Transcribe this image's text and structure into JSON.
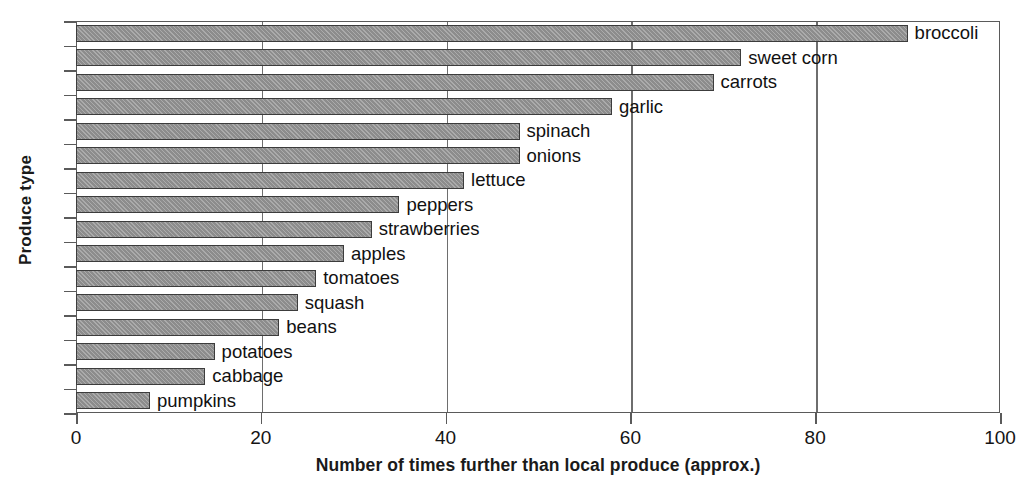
{
  "chart_data": {
    "type": "bar",
    "orientation": "horizontal",
    "title": "",
    "xlabel": "Number of times further than local produce (approx.)",
    "ylabel": "Produce type",
    "categories": [
      "broccoli",
      "sweet corn",
      "carrots",
      "garlic",
      "spinach",
      "onions",
      "lettuce",
      "peppers",
      "strawberries",
      "apples",
      "tomatoes",
      "squash",
      "beans",
      "potatoes",
      "cabbage",
      "pumpkins"
    ],
    "values": [
      90,
      72,
      69,
      58,
      48,
      48,
      42,
      35,
      32,
      29,
      26,
      24,
      22,
      15,
      14,
      8
    ],
    "xlim": [
      0,
      100
    ],
    "xticks": [
      0,
      20,
      40,
      60,
      80,
      100
    ],
    "xtick_labels": [
      "0",
      "20",
      "40",
      "60",
      "80",
      "100"
    ],
    "grid": true,
    "grid_axis": "x",
    "legend": false,
    "bar_color": "#949494",
    "bar_edge_color": "#3c3c3c",
    "axis_color": "#5a5a5a",
    "labels_inline": true
  }
}
